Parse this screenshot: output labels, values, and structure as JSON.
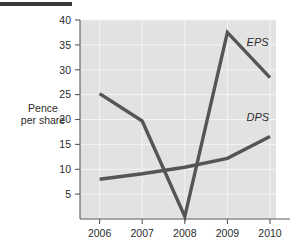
{
  "figure": {
    "top_rule_color": "#3a3a3a",
    "plot_background": "#e2e2e2",
    "axis_color": "#5a5a5a",
    "gridline_color": "#f2f2f2",
    "series_color": "#555555",
    "text_color": "#2b2b2b",
    "y_axis_caption_line1": "Pence",
    "y_axis_caption_line2": "per share"
  },
  "chart_data": {
    "type": "line",
    "title": "",
    "subtitle": "",
    "xlabel": "",
    "ylabel": "Pence per share",
    "categories": [
      "2006",
      "2007",
      "2008",
      "2009",
      "2010"
    ],
    "x": [
      2006,
      2007,
      2008,
      2009,
      2010
    ],
    "xlim": [
      2005.7,
      2010.3
    ],
    "ylim": [
      0,
      40
    ],
    "yticks": [
      5,
      10,
      15,
      20,
      25,
      30,
      35,
      40
    ],
    "ytick_labels": [
      "5",
      "10",
      "15",
      "20",
      "25",
      "30",
      "35",
      "40"
    ],
    "xtick_labels": [
      "2006",
      "2007",
      "2008",
      "2009",
      "2010"
    ],
    "grid": true,
    "grid_axis": "both",
    "legend": "inline-annotations",
    "legend_position": "right-inline",
    "series": [
      {
        "name": "EPS",
        "label": "EPS",
        "color": "#555555",
        "values": [
          25.2,
          19.7,
          0.5,
          37.5,
          28.4
        ],
        "annotation": {
          "text": "EPS",
          "x": 2009.45,
          "y": 34.8
        }
      },
      {
        "name": "DPS",
        "label": "DPS",
        "color": "#555555",
        "values": [
          8.0,
          9.1,
          10.4,
          12.2,
          16.6
        ],
        "annotation": {
          "text": "DPS",
          "x": 2009.45,
          "y": 19.6
        }
      }
    ],
    "annotations": [
      {
        "name": "eps-series-label",
        "text": "EPS"
      },
      {
        "name": "dps-series-label",
        "text": "DPS"
      }
    ]
  }
}
